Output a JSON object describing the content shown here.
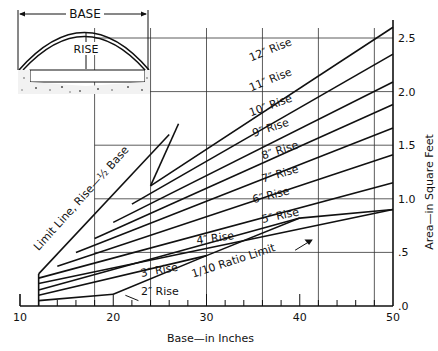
{
  "chart_data": {
    "type": "line",
    "title": "",
    "xlabel": "Base—in Inches",
    "ylabel": "Area—in Square Feet",
    "xlim": [
      10,
      50
    ],
    "ylim": [
      0,
      2.5
    ],
    "x_ticks": [
      "10",
      "20",
      "30",
      "40",
      "50"
    ],
    "y_ticks": [
      ".0",
      ".5",
      "1.0",
      "1.5",
      "2.0",
      "2.5"
    ],
    "x_tick_values": [
      10,
      20,
      30,
      40,
      50
    ],
    "y_tick_values": [
      0,
      0.5,
      1.0,
      1.5,
      2.0,
      2.5
    ],
    "vertical_gridlines": [
      18,
      24,
      30,
      36,
      42,
      48
    ],
    "horizontal_gridlines": [
      0.5,
      1.0,
      1.5,
      2.0,
      2.5
    ],
    "grid": true,
    "series": [
      {
        "name": "2\" Rise",
        "label": "2″ Rise",
        "x": [
          12,
          20
        ],
        "y": [
          0.05,
          0.11
        ]
      },
      {
        "name": "3\" Rise",
        "label": "3″ Rise",
        "x": [
          12,
          30
        ],
        "y": [
          0.1,
          0.47
        ]
      },
      {
        "name": "4\" Rise",
        "label": "4″ Rise",
        "x": [
          12,
          40
        ],
        "y": [
          0.15,
          0.82
        ]
      },
      {
        "name": "5\" Rise",
        "label": "5″ Rise",
        "x": [
          12,
          50
        ],
        "y": [
          0.21,
          0.9
        ]
      },
      {
        "name": "6\" Rise",
        "label": "6″ Rise",
        "x": [
          12,
          50
        ],
        "y": [
          0.26,
          1.15
        ]
      },
      {
        "name": "7\" Rise",
        "label": "7″ Rise",
        "x": [
          14,
          50
        ],
        "y": [
          0.37,
          1.41
        ]
      },
      {
        "name": "8\" Rise",
        "label": "8″ Rise",
        "x": [
          16,
          50
        ],
        "y": [
          0.5,
          1.66
        ]
      },
      {
        "name": "9\" Rise",
        "label": "9″ Rise",
        "x": [
          18,
          50
        ],
        "y": [
          0.63,
          1.88
        ]
      },
      {
        "name": "10\" Rise",
        "label": "10″ Rise",
        "x": [
          20,
          50
        ],
        "y": [
          0.78,
          2.09
        ]
      },
      {
        "name": "11\" Rise",
        "label": "11″ Rise",
        "x": [
          22,
          50
        ],
        "y": [
          0.95,
          2.35
        ]
      },
      {
        "name": "12\" Rise",
        "label": "12″ Rise",
        "x": [
          24,
          50
        ],
        "y": [
          1.12,
          2.6
        ]
      },
      {
        "name": "Limit Line, Rise = 1/2 Base",
        "label": "Limit Line, Rise—½ Base",
        "x": [
          12,
          26
        ],
        "y": [
          0.3,
          1.6
        ]
      },
      {
        "name": "1/10 Ratio Limit",
        "label": "1/10 Ratio Limit",
        "x": [
          20,
          30,
          40,
          50
        ],
        "y": [
          0.11,
          0.47,
          0.82,
          0.9
        ]
      }
    ],
    "annotations": [
      "1/10 Ratio Limit",
      "Limit Line, Rise—½ Base"
    ]
  },
  "inset": {
    "base_label": "BASE",
    "rise_label": "RISE"
  }
}
